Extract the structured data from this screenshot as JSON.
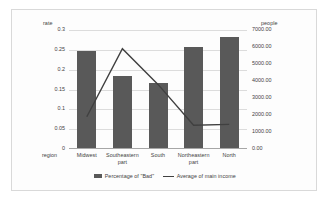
{
  "chart_data": {
    "type": "bar",
    "title": "",
    "categories": [
      "Midwest",
      "Southeastern part",
      "South",
      "Northeastern part",
      "North"
    ],
    "xlabel": "region",
    "grid": true,
    "legend_position": "bottom",
    "axes": {
      "left": {
        "label": "rate",
        "min": 0,
        "max": 0.3,
        "ticks": [
          "0.3",
          "0.25",
          "0.2",
          "0.15",
          "0.1",
          "0.05",
          "0"
        ],
        "tick_values": [
          0.3,
          0.25,
          0.2,
          0.15,
          0.1,
          0.05,
          0
        ]
      },
      "right": {
        "label": "people",
        "min": 0,
        "max": 7000,
        "ticks": [
          "7000.00",
          "6000.00",
          "5000.00",
          "4000.00",
          "3000.00",
          "2000.00",
          "1000.00",
          "0.00"
        ],
        "tick_values": [
          7000,
          6000,
          5000,
          4000,
          3000,
          2000,
          1000,
          0
        ]
      }
    },
    "series": [
      {
        "name": "Percentage of \"Bad\"",
        "type": "bar",
        "axis": "left",
        "color": "#595959",
        "values": [
          0.247,
          0.184,
          0.167,
          0.256,
          0.283
        ]
      },
      {
        "name": "Average of main income",
        "type": "line",
        "axis": "right",
        "color": "#404040",
        "values": [
          1900,
          5900,
          3800,
          1400,
          1450
        ]
      }
    ]
  },
  "legend": {
    "entries": [
      {
        "label": "Percentage of \"Bad\"",
        "marker": "bar-swatch-icon"
      },
      {
        "label": "Average of main income",
        "marker": "line-swatch-icon"
      }
    ]
  }
}
